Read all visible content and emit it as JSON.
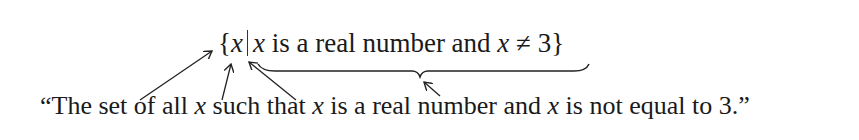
{
  "notation": {
    "open_brace": "{",
    "variable": "x",
    "condition_var": "x",
    "condition_text": " is a real number and ",
    "condition_var2": "x",
    "neq": " ≠ 3",
    "close_brace": "}"
  },
  "sentence": {
    "open_quote": "“The set of all ",
    "var1": "x",
    "part2": " such that ",
    "var2": "x",
    "part3": " is a real number and ",
    "var3": "x",
    "part4": " is not equal to 3.”"
  },
  "annotations": {
    "arrows": [
      "brace-to-the-set-of",
      "x-to-all-x",
      "bar-to-such-that",
      "underbrace-to-condition"
    ]
  }
}
